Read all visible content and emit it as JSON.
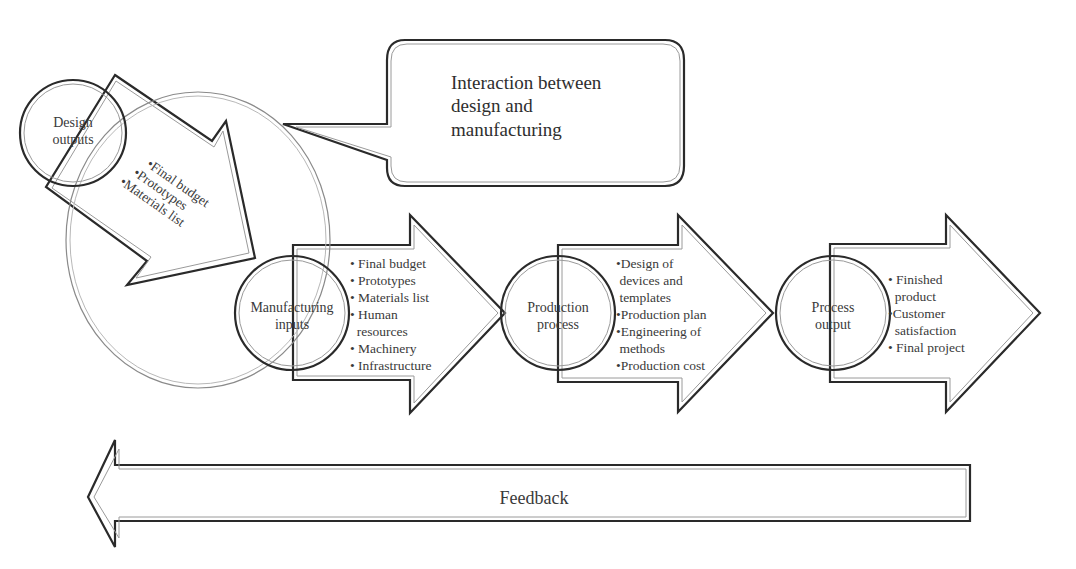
{
  "diagram": {
    "callout": {
      "lines": [
        "Interaction between",
        "design and",
        "manufacturing"
      ]
    },
    "design_outputs": {
      "label_lines": [
        "Design",
        "outputs"
      ],
      "items": [
        "•Final budget",
        "•Prototypes",
        "•Materials list"
      ]
    },
    "stages": [
      {
        "label_lines": [
          "Manufacturing",
          "inputs"
        ],
        "items": [
          "• Final budget",
          "• Prototypes",
          "• Materials list",
          "• Human",
          "  resources",
          "• Machinery",
          "• Infrastructure"
        ]
      },
      {
        "label_lines": [
          "Production",
          "process"
        ],
        "items": [
          "•Design of",
          " devices and",
          " templates",
          "•Production plan",
          "•Engineering of",
          " methods",
          "•Production cost"
        ]
      },
      {
        "label_lines": [
          "Process",
          "output"
        ],
        "items": [
          "• Finished",
          "  product",
          "•Customer",
          "  satisfaction",
          "• Final project"
        ]
      }
    ],
    "feedback": {
      "label": "Feedback"
    },
    "colors": {
      "stroke": "#2a2a2a",
      "inner_stroke": "#9a9a9a",
      "interaction_ellipse": "#8a8a8a",
      "text": "#3a3a3a"
    }
  }
}
